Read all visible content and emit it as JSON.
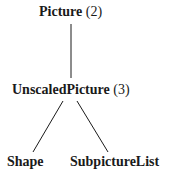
{
  "diagram": {
    "type": "tree",
    "nodes": [
      {
        "id": "picture",
        "name": "Picture",
        "count": "(2)"
      },
      {
        "id": "unscaled",
        "name": "UnscaledPicture",
        "count": "(3)"
      },
      {
        "id": "shape",
        "name": "Shape",
        "count": ""
      },
      {
        "id": "subpicturelist",
        "name": "SubpictureList",
        "count": ""
      }
    ],
    "edges": [
      {
        "from": "picture",
        "to": "unscaled"
      },
      {
        "from": "unscaled",
        "to": "shape"
      },
      {
        "from": "unscaled",
        "to": "subpicturelist"
      }
    ],
    "colors": {
      "text": "#1a1a1a",
      "line": "#1a1a1a",
      "background": "#ffffff"
    }
  }
}
